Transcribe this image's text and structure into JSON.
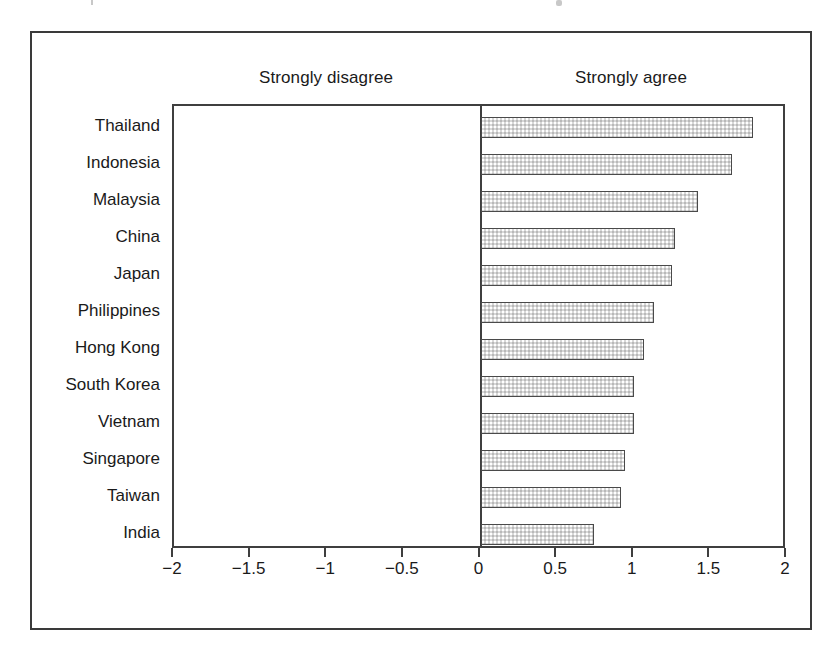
{
  "figure": {
    "frame": true,
    "background_color": "#ffffff",
    "border_color": "#3a3a3a"
  },
  "header": {
    "left_pole_label": "Strongly disagree",
    "right_pole_label": "Strongly agree"
  },
  "axis": {
    "tick_labels": [
      "−2",
      "−1.5",
      "−1",
      "−0.5",
      "0",
      "0.5",
      "1",
      "1.5",
      "2"
    ],
    "tick_values": [
      -2,
      -1.5,
      -1,
      -0.5,
      0,
      0.5,
      1,
      1.5,
      2
    ],
    "min": -2,
    "max": 2
  },
  "style": {
    "bar_fill": "#d8d8d8",
    "bar_border": "#4a4a4a",
    "axis_color": "#3f3f3f",
    "text_color": "#1a1a1a"
  },
  "chart_data": {
    "type": "bar",
    "orientation": "horizontal",
    "title": "",
    "subtitle": "",
    "xlabel": "",
    "ylabel": "",
    "xlim": [
      -2,
      2
    ],
    "grid": false,
    "legend": false,
    "annotations": [
      "Strongly disagree",
      "Strongly agree"
    ],
    "categories": [
      "Thailand",
      "Indonesia",
      "Malaysia",
      "China",
      "Japan",
      "Philippines",
      "Hong Kong",
      "South Korea",
      "Vietnam",
      "Singapore",
      "Taiwan",
      "India"
    ],
    "values": [
      1.78,
      1.64,
      1.42,
      1.27,
      1.25,
      1.13,
      1.07,
      1.0,
      1.0,
      0.94,
      0.92,
      0.74
    ],
    "series": [
      {
        "name": "Mean response",
        "values": [
          1.78,
          1.64,
          1.42,
          1.27,
          1.25,
          1.13,
          1.07,
          1.0,
          1.0,
          0.94,
          0.92,
          0.74
        ]
      }
    ]
  }
}
